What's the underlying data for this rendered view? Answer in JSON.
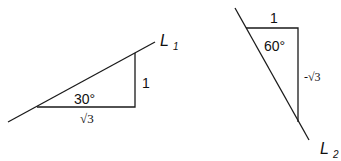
{
  "diagram": {
    "left": {
      "line_label": "L",
      "line_subscript": "1",
      "angle_label": "30°",
      "opposite_label": "1",
      "adjacent_label": "√3"
    },
    "right": {
      "line_label": "L",
      "line_subscript": "2",
      "angle_label": "60°",
      "top_label": "1",
      "side_label": "-√3"
    },
    "stroke_color": "#1a1a1a"
  }
}
